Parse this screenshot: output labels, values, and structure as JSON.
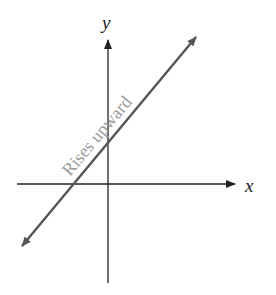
{
  "diagram": {
    "axes": {
      "x_label": "x",
      "y_label": "y"
    },
    "line": {
      "label": "Rises upward",
      "slope_direction": "positive",
      "color": "#555555"
    },
    "colors": {
      "axis": "#222222",
      "line": "#555555",
      "label": "#9a9a9a"
    }
  }
}
